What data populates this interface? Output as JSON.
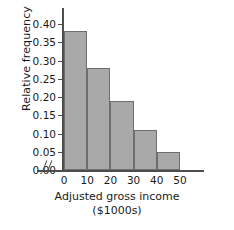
{
  "chart_data": {
    "type": "bar",
    "title": "",
    "xlabel": "Adjusted gross income",
    "xlabel_line2": "($1000s)",
    "ylabel": "Relative frequency",
    "categories": [
      "0-10",
      "10-20",
      "20-30",
      "30-40",
      "40-50"
    ],
    "bin_edges": [
      0,
      10,
      20,
      30,
      40,
      50
    ],
    "values": [
      0.38,
      0.28,
      0.19,
      0.11,
      0.05
    ],
    "ylim": [
      0.0,
      0.4
    ],
    "xlim": [
      0,
      50
    ],
    "ytick_labels": [
      "0.00",
      "0.05",
      "0.10",
      "0.15",
      "0.20",
      "0.25",
      "0.30",
      "0.35",
      "0.40"
    ],
    "ytick_values": [
      0.0,
      0.05,
      0.1,
      0.15,
      0.2,
      0.25,
      0.3,
      0.35,
      0.4
    ],
    "xtick_labels": [
      "0",
      "10",
      "20",
      "30",
      "40",
      "50"
    ],
    "xtick_values": [
      0,
      10,
      20,
      30,
      40,
      50
    ],
    "grid": false,
    "legend": false,
    "axis_break_x": true,
    "bar_fill_color": "#a9a9a9",
    "bar_edge_color": "#6e6e6e",
    "axis_color": "#4d4d4d",
    "text_color": "#1a1a1a",
    "background_color": "#ffffff"
  }
}
